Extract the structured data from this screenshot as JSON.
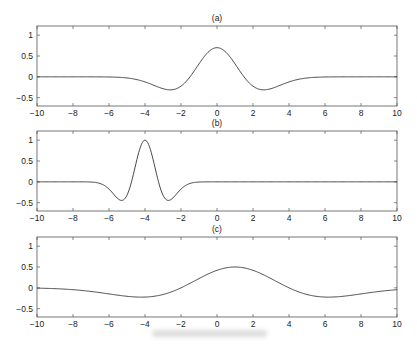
{
  "chart_data": [
    {
      "type": "line",
      "title": "(a)",
      "xlabel": "",
      "ylabel": "",
      "xlim": [
        -10,
        10
      ],
      "ylim": [
        -0.7,
        1.22
      ],
      "xticks": [
        -10,
        -8,
        -6,
        -4,
        -2,
        0,
        2,
        4,
        6,
        8,
        10
      ],
      "yticks": [
        -0.5,
        0,
        0.5,
        1
      ],
      "grid": false,
      "series": [
        {
          "name": "mexican hat wavelet",
          "shape": {
            "center": 0,
            "scale": 1.5,
            "amplitude": 0.7
          },
          "x": [
            -10,
            -8,
            -6,
            -4,
            -3,
            -2.6,
            -2,
            -1,
            0,
            1,
            2,
            2.6,
            3,
            4,
            6,
            8,
            10
          ],
          "y": [
            0,
            0,
            -0.01,
            -0.13,
            -0.28,
            -0.31,
            -0.23,
            0.38,
            0.7,
            0.38,
            -0.23,
            -0.31,
            -0.28,
            -0.13,
            -0.01,
            0,
            0
          ]
        }
      ]
    },
    {
      "type": "line",
      "title": "(b)",
      "xlabel": "",
      "ylabel": "",
      "xlim": [
        -10,
        10
      ],
      "ylim": [
        -0.7,
        1.22
      ],
      "xticks": [
        -10,
        -8,
        -6,
        -4,
        -2,
        0,
        2,
        4,
        6,
        8,
        10
      ],
      "yticks": [
        -0.5,
        0,
        0.5,
        1
      ],
      "grid": false,
      "series": [
        {
          "name": "mexican hat wavelet",
          "shape": {
            "center": -4,
            "scale": 0.75,
            "amplitude": 1.0
          },
          "x": [
            -10,
            -7,
            -6,
            -5.3,
            -4.75,
            -4,
            -3.25,
            -2.7,
            -2,
            -1,
            0,
            10
          ],
          "y": [
            0,
            -0.01,
            -0.16,
            -0.45,
            0,
            1,
            0,
            -0.45,
            -0.16,
            -0.01,
            0,
            0
          ]
        }
      ]
    },
    {
      "type": "line",
      "title": "(c)",
      "xlabel": "",
      "ylabel": "",
      "xlim": [
        -10,
        10
      ],
      "ylim": [
        -0.7,
        1.22
      ],
      "xticks": [
        -10,
        -8,
        -6,
        -4,
        -2,
        0,
        2,
        4,
        6,
        8,
        10
      ],
      "yticks": [
        -0.5,
        0,
        0.5,
        1
      ],
      "grid": false,
      "series": [
        {
          "name": "mexican hat wavelet",
          "shape": {
            "center": 1,
            "scale": 3.0,
            "amplitude": 0.5
          },
          "x": [
            -10,
            -8,
            -6,
            -4.2,
            -2,
            0,
            1,
            2,
            4,
            6.2,
            8,
            10
          ],
          "y": [
            -0.01,
            -0.05,
            -0.15,
            -0.22,
            0,
            0.42,
            0.5,
            0.42,
            0,
            -0.22,
            -0.15,
            -0.05
          ]
        }
      ]
    }
  ],
  "figure": {
    "panel_titles": [
      "(a)",
      "(b)",
      "(c)"
    ],
    "ytick_labels": [
      "1",
      "0.5",
      "0",
      "−0.5"
    ],
    "xtick_labels": [
      "−10",
      "−8",
      "−6",
      "−4",
      "−2",
      "0",
      "2",
      "4",
      "6",
      "8",
      "10"
    ],
    "line_color": "#333333",
    "axis_color": "#555555"
  }
}
